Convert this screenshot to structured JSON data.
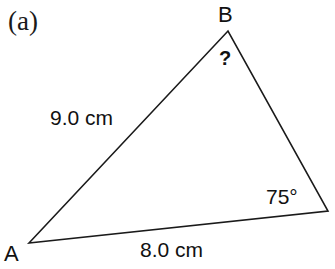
{
  "figure": {
    "part_label": "(a)",
    "background_color": "#ffffff",
    "stroke_color": "#1a1a1a",
    "stroke_width": 1.6,
    "shape": "triangle",
    "width": 335,
    "height": 269
  },
  "vertices": [
    {
      "name": "A",
      "label": "A",
      "x": 29,
      "y": 243,
      "label_shown": true
    },
    {
      "name": "B",
      "label": "B",
      "x": 228,
      "y": 31,
      "label_shown": true
    },
    {
      "name": "C",
      "label": "",
      "x": 328,
      "y": 211,
      "label_shown": false
    }
  ],
  "sides": [
    {
      "name": "AB",
      "label": "9.0 cm",
      "value": 9.0,
      "unit": "cm",
      "from": "A",
      "to": "B"
    },
    {
      "name": "AC",
      "label": "8.0 cm",
      "value": 8.0,
      "unit": "cm",
      "from": "A",
      "to": "C"
    },
    {
      "name": "BC",
      "label": "",
      "value": null,
      "unit": "",
      "from": "B",
      "to": "C"
    }
  ],
  "angles": [
    {
      "at": "B",
      "label": "?",
      "value": null,
      "unit": "",
      "known": false
    },
    {
      "at": "C",
      "label": "75°",
      "value": 75,
      "unit": "degrees",
      "known": true
    }
  ],
  "chart_data": {
    "type": "diagram",
    "title": "(a)",
    "shape": "triangle",
    "points": {
      "A": [
        29,
        243
      ],
      "B": [
        228,
        31
      ],
      "C": [
        328,
        211
      ]
    },
    "side_labels": {
      "AB": "9.0 cm",
      "AC": "8.0 cm",
      "BC": ""
    },
    "angle_labels": {
      "B": "?",
      "C": "75°"
    }
  }
}
